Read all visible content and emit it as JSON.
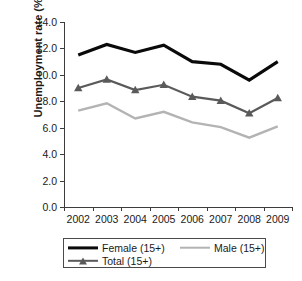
{
  "chart_data": {
    "type": "line",
    "title": "",
    "xlabel": "",
    "ylabel": "Unemployment rate (%)",
    "categories": [
      "2002",
      "2003",
      "2004",
      "2005",
      "2006",
      "2007",
      "2008",
      "2009"
    ],
    "x": [
      2002,
      2003,
      2004,
      2005,
      2006,
      2007,
      2008,
      2009
    ],
    "ylim": [
      0.0,
      14.0
    ],
    "yticks": [
      "0.0",
      "2.0",
      "4.0",
      "6.0",
      "8.0",
      "10.0",
      "12.0",
      "14.0"
    ],
    "ytick_values": [
      0.0,
      2.0,
      4.0,
      6.0,
      8.0,
      10.0,
      12.0,
      14.0
    ],
    "grid": false,
    "legend_position": "bottom",
    "series": [
      {
        "name": "Female (15+)",
        "values": [
          11.5,
          12.3,
          11.7,
          12.25,
          11.0,
          10.8,
          9.6,
          11.0
        ],
        "color": "#0a0a0a",
        "width": 3.1,
        "marker": "none"
      },
      {
        "name": "Male (15+)",
        "values": [
          7.3,
          7.85,
          6.7,
          7.2,
          6.4,
          6.05,
          5.25,
          6.1
        ],
        "color": "#b3b3b3",
        "width": 2.4,
        "marker": "none"
      },
      {
        "name": "Total (15+)",
        "values": [
          9.0,
          9.65,
          8.85,
          9.25,
          8.35,
          8.05,
          7.1,
          8.25
        ],
        "color": "#5a5a5a",
        "width": 2.2,
        "marker": "triangle"
      }
    ]
  },
  "legend": {
    "entries": [
      {
        "label": "Female (15+)"
      },
      {
        "label": "Male (15+)"
      },
      {
        "label": "Total (15+)"
      }
    ]
  },
  "axes": {
    "y_title": "Unemployment rate (%)"
  }
}
